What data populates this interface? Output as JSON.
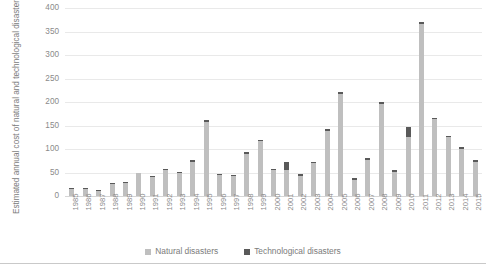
{
  "chart_data": {
    "type": "bar",
    "title": "",
    "subtitle": "",
    "xlabel": "",
    "ylabel": "Estimated annual cost of natural and technological disasters (US$ billions)",
    "ylim": [
      0,
      400
    ],
    "yticks": [
      0,
      50,
      100,
      150,
      200,
      250,
      300,
      350,
      400
    ],
    "ytick_labels": [
      "0",
      "50",
      "100",
      "150",
      "200",
      "250",
      "300",
      "350",
      "400"
    ],
    "grid": true,
    "stacked": true,
    "legend_position": "bottom",
    "categories": [
      "1985",
      "1986",
      "1987",
      "1988",
      "1989",
      "1990",
      "1991",
      "1992",
      "1993",
      "1994",
      "1995",
      "1996",
      "1997",
      "1998",
      "1999",
      "2000",
      "2001",
      "2002",
      "2003",
      "2004",
      "2005",
      "2006",
      "2007",
      "2008",
      "2009",
      "2010",
      "2011",
      "2012",
      "2013",
      "2014",
      "2015"
    ],
    "series": [
      {
        "name": "Natural disasters",
        "color": "#bfbfbf",
        "values": [
          14,
          14,
          11,
          25,
          27,
          48,
          41,
          56,
          50,
          73,
          158,
          45,
          42,
          90,
          116,
          55,
          55,
          43,
          70,
          139,
          218,
          35,
          77,
          196,
          52,
          125,
          365,
          163,
          125,
          101,
          73
        ]
      },
      {
        "name": "Technological disasters",
        "color": "#595959",
        "values": [
          2,
          3,
          2,
          3,
          3,
          2,
          2,
          2,
          2,
          3,
          3,
          2,
          2,
          3,
          3,
          3,
          18,
          4,
          3,
          4,
          4,
          3,
          3,
          4,
          3,
          22,
          5,
          4,
          3,
          3,
          3
        ]
      }
    ]
  },
  "legend": {
    "items": [
      {
        "label": "Natural disasters",
        "swatch": "natural-disasters-swatch"
      },
      {
        "label": "Technological disasters",
        "swatch": "technological-disasters-swatch"
      }
    ]
  }
}
